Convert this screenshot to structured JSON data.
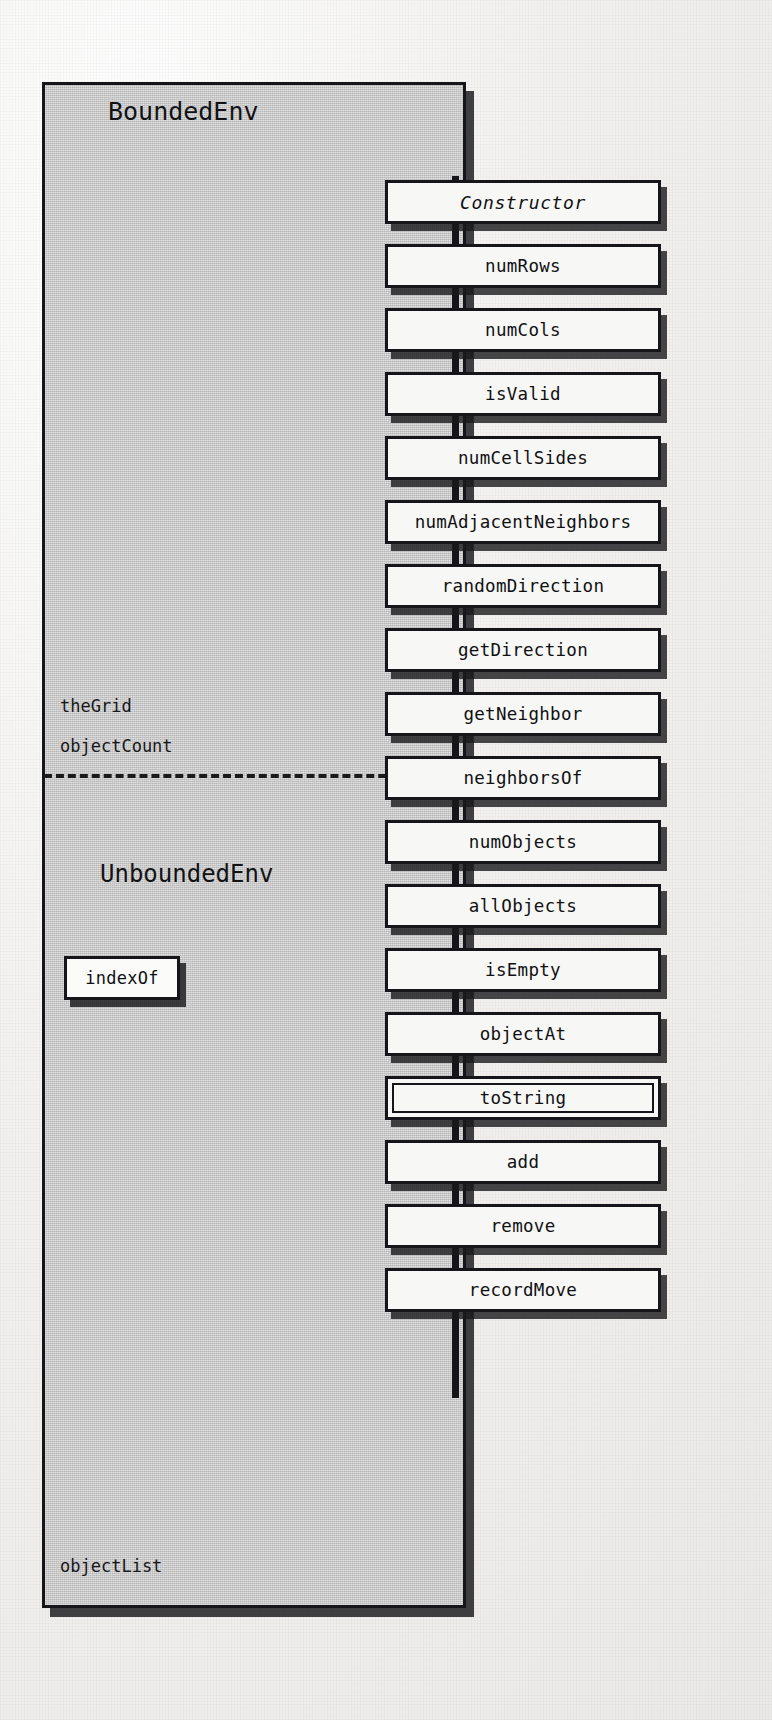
{
  "diagram": {
    "kind": "uml-class-diagram",
    "colors": {
      "page_background": "#f2f1ef",
      "class_fill": "#c9c9c9",
      "method_fill": "#f7f7f5",
      "ink": "#15151a",
      "shadow": "rgba(25,25,28,0.82)"
    },
    "classes": [
      {
        "name": "BoundedEnv",
        "fields": [
          "theGrid",
          "objectCount"
        ]
      },
      {
        "name": "UnboundedEnv",
        "fields": [
          "objectList"
        ],
        "methods": [
          "indexOf"
        ]
      }
    ],
    "bounded_title": "BoundedEnv",
    "unbounded_title": "UnboundedEnv",
    "field_theGrid": "theGrid",
    "field_objectCount": "objectCount",
    "field_objectList": "objectList",
    "indexOf_label": "indexOf",
    "methods": [
      {
        "label": "Constructor",
        "style": "italic"
      },
      {
        "label": "numRows",
        "style": "plain"
      },
      {
        "label": "numCols",
        "style": "plain"
      },
      {
        "label": "isValid",
        "style": "plain"
      },
      {
        "label": "numCellSides",
        "style": "plain"
      },
      {
        "label": "numAdjacentNeighbors",
        "style": "plain"
      },
      {
        "label": "randomDirection",
        "style": "plain"
      },
      {
        "label": "getDirection",
        "style": "plain"
      },
      {
        "label": "getNeighbor",
        "style": "plain"
      },
      {
        "label": "neighborsOf",
        "style": "plain"
      },
      {
        "label": "numObjects",
        "style": "plain"
      },
      {
        "label": "allObjects",
        "style": "plain"
      },
      {
        "label": "isEmpty",
        "style": "plain"
      },
      {
        "label": "objectAt",
        "style": "plain"
      },
      {
        "label": "toString",
        "style": "double"
      },
      {
        "label": "add",
        "style": "plain"
      },
      {
        "label": "remove",
        "style": "plain"
      },
      {
        "label": "recordMove",
        "style": "plain"
      }
    ],
    "ghost_text": [
      {
        "text": "ells",
        "x": 62,
        "y": 228,
        "size": 46
      },
      {
        "text": "ents",
        "x": 62,
        "y": 298,
        "size": 46
      }
    ]
  }
}
